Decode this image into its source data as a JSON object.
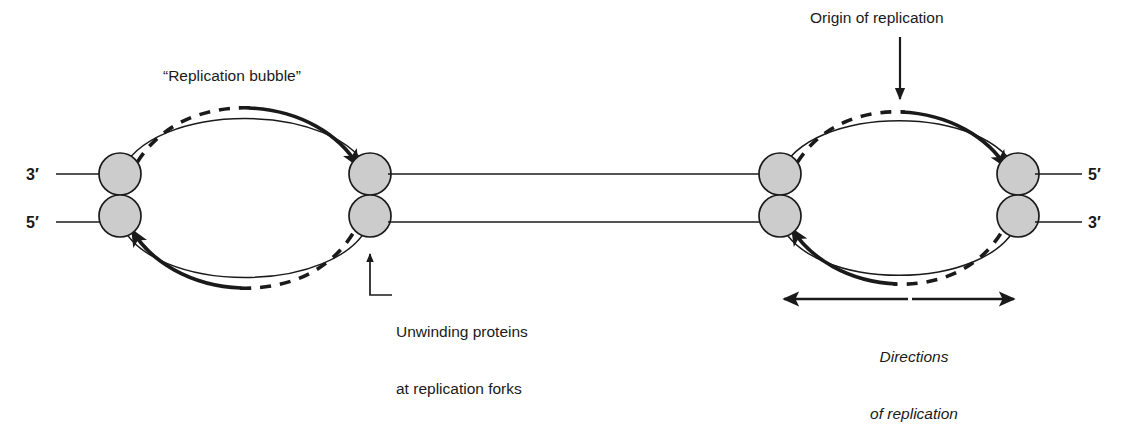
{
  "figure": {
    "background_color": "#ffffff",
    "line_color": "#1a1a1a",
    "protein_fill_color": "#cccccc",
    "protein_stroke_color": "#1a1a1a"
  },
  "labels": {
    "replication_bubble": "“Replication bubble”",
    "origin_of_replication": "Origin of replication",
    "unwinding_proteins_line1": "Unwinding proteins",
    "unwinding_proteins_line2": "at replication forks",
    "directions_line1": "Directions",
    "directions_line2": "of replication"
  },
  "strand_ends": {
    "left_top": "3′",
    "left_bottom": "5′",
    "right_top": "5′",
    "right_bottom": "3′"
  },
  "bubbles": [
    {
      "name": "left-replication-bubble",
      "left_fork_x": 120,
      "right_fork_x": 370,
      "top_strand_direction": "rightward",
      "bottom_strand_direction": "leftward",
      "proteins": 4
    },
    {
      "name": "right-replication-bubble",
      "left_fork_x": 780,
      "right_fork_x": 1018,
      "top_strand_direction": "rightward",
      "bottom_strand_direction": "leftward",
      "proteins": 4
    }
  ],
  "annotations": {
    "origin_arrow": "downward arrow pointing to top of right bubble",
    "unwinding_leader": "elbow leader line with upward arrow to lower-right fork protein of left bubble",
    "direction_arrows": "double-headed horizontal arrows spanning the right bubble"
  }
}
